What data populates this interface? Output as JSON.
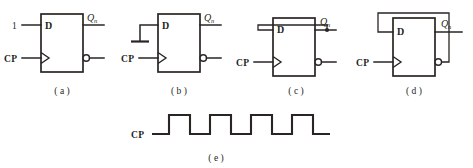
{
  "document": {
    "kind": "digital-logic-figure-sheet",
    "description": "Four D flip-flop wiring configurations (a)-(d) and a CP clock waveform (e)"
  },
  "labels": {
    "d_input": "D",
    "clock_input": "CP",
    "q_output": "Q",
    "q_subscript": "n",
    "logic_one": "1"
  },
  "figures": [
    {
      "id": "a",
      "caption": "( a )",
      "d_source": "1",
      "d_label": "D",
      "clock_label": "CP",
      "q_label": "Q",
      "q_subscript": "n",
      "has_feedback": false,
      "has_ground": false,
      "has_logic_one": true,
      "has_qbar_bubble": true
    },
    {
      "id": "b",
      "caption": "( b )",
      "d_source": "ground",
      "d_label": "D",
      "clock_label": "CP",
      "q_label": "Q",
      "q_subscript": "n",
      "has_feedback": false,
      "has_ground": true,
      "has_logic_one": false,
      "has_qbar_bubble": true
    },
    {
      "id": "c",
      "caption": "( c )",
      "d_source": "Q",
      "d_label": "D",
      "clock_label": "CP",
      "q_label": "Q",
      "q_subscript": "n",
      "has_feedback": true,
      "feedback_from": "Q",
      "has_ground": false,
      "has_logic_one": false,
      "has_qbar_bubble": true
    },
    {
      "id": "d",
      "caption": "( d )",
      "d_source": "Qbar",
      "d_label": "D",
      "clock_label": "CP",
      "q_label": "Q",
      "q_subscript": "n",
      "has_feedback": true,
      "feedback_from": "Qbar",
      "has_ground": false,
      "has_logic_one": false,
      "has_qbar_bubble": true
    }
  ],
  "waveform": {
    "id": "e",
    "caption": "( e )",
    "signal_label": "CP",
    "pulse_count": 4,
    "description": "Rectangular clock pulse train, starts low, four high pulses, ends high"
  },
  "colors": {
    "ink": "#2a2523",
    "paper": "#ffffff"
  }
}
